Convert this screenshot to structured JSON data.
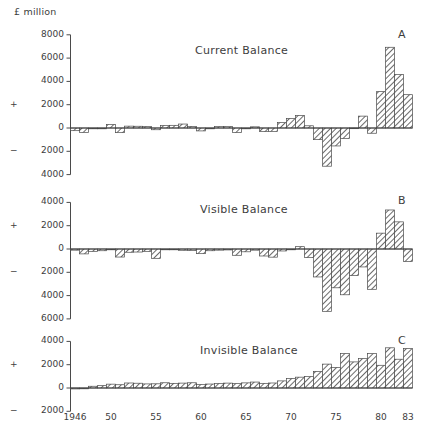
{
  "figure": {
    "unit_label": "£ million",
    "plus_sign": "+",
    "minus_sign": "−"
  },
  "xaxis": {
    "tick_labels": [
      "1946",
      "50",
      "55",
      "60",
      "65",
      "70",
      "75",
      "80",
      "83"
    ],
    "tick_years": [
      1946,
      1950,
      1955,
      1960,
      1965,
      1970,
      1975,
      1980,
      1983
    ],
    "range": [
      1946,
      1983
    ]
  },
  "panels": [
    {
      "letter": "A",
      "title": "Current Balance",
      "ylim": [
        -4000,
        8000
      ],
      "yticks": [
        8000,
        6000,
        4000,
        2000,
        0,
        -2000,
        -4000
      ],
      "ytick_labels": [
        "8000",
        "6000",
        "4000",
        "2000",
        "0",
        "2000",
        "4000"
      ]
    },
    {
      "letter": "B",
      "title": "Visible Balance",
      "ylim": [
        -6000,
        4000
      ],
      "yticks": [
        4000,
        2000,
        0,
        -2000,
        -4000,
        -6000
      ],
      "ytick_labels": [
        "4000",
        "2000",
        "0",
        "2000",
        "4000",
        "6000"
      ]
    },
    {
      "letter": "C",
      "title": "Invisible Balance",
      "ylim": [
        -2000,
        4000
      ],
      "yticks": [
        4000,
        2000,
        0,
        -2000
      ],
      "ytick_labels": [
        "4000",
        "2000",
        "0",
        "2000"
      ]
    }
  ],
  "chart_data": [
    {
      "type": "bar",
      "title": "Current Balance",
      "panel": "A",
      "xlabel": "",
      "ylabel": "£ million",
      "ylim": [
        -4000,
        8000
      ],
      "grid": false,
      "categories": [
        1946,
        1947,
        1948,
        1949,
        1950,
        1951,
        1952,
        1953,
        1954,
        1955,
        1956,
        1957,
        1958,
        1959,
        1960,
        1961,
        1962,
        1963,
        1964,
        1965,
        1966,
        1967,
        1968,
        1969,
        1970,
        1971,
        1972,
        1973,
        1974,
        1975,
        1976,
        1977,
        1978,
        1979,
        1980,
        1981,
        1982,
        1983
      ],
      "values": [
        -230,
        -380,
        -20,
        -10,
        300,
        -400,
        160,
        150,
        120,
        -150,
        210,
        230,
        340,
        140,
        -250,
        -10,
        120,
        120,
        -390,
        -50,
        100,
        -310,
        -290,
        460,
        820,
        1080,
        190,
        -1000,
        -3280,
        -1540,
        -900,
        10,
        1020,
        -450,
        3120,
        6930,
        4590,
        2860
      ]
    },
    {
      "type": "bar",
      "title": "Visible Balance",
      "panel": "B",
      "xlabel": "",
      "ylabel": "£ million",
      "ylim": [
        -6000,
        4000
      ],
      "grid": false,
      "categories": [
        1946,
        1947,
        1948,
        1949,
        1950,
        1951,
        1952,
        1953,
        1954,
        1955,
        1956,
        1957,
        1958,
        1959,
        1960,
        1961,
        1962,
        1963,
        1964,
        1965,
        1966,
        1967,
        1968,
        1969,
        1970,
        1971,
        1972,
        1973,
        1974,
        1975,
        1976,
        1977,
        1978,
        1979,
        1980,
        1981,
        1982,
        1983
      ],
      "values": [
        -100,
        -420,
        -200,
        -150,
        -50,
        -690,
        -280,
        -260,
        -200,
        -800,
        -50,
        -30,
        -110,
        -120,
        -400,
        -150,
        -100,
        -80,
        -540,
        -240,
        -100,
        -600,
        -700,
        -170,
        -20,
        200,
        -740,
        -2400,
        -5350,
        -3330,
        -3930,
        -2280,
        -1540,
        -3460,
        1360,
        3350,
        2330,
        -1070
      ]
    },
    {
      "type": "bar",
      "title": "Invisible Balance",
      "panel": "C",
      "xlabel": "",
      "ylabel": "£ million",
      "ylim": [
        -2000,
        4000
      ],
      "grid": false,
      "categories": [
        1946,
        1947,
        1948,
        1949,
        1950,
        1951,
        1952,
        1953,
        1954,
        1955,
        1956,
        1957,
        1958,
        1959,
        1960,
        1961,
        1962,
        1963,
        1964,
        1965,
        1966,
        1967,
        1968,
        1969,
        1970,
        1971,
        1972,
        1973,
        1974,
        1975,
        1976,
        1977,
        1978,
        1979,
        1980,
        1981,
        1982,
        1983
      ],
      "values": [
        -80,
        -60,
        150,
        200,
        330,
        280,
        430,
        410,
        350,
        360,
        450,
        400,
        420,
        450,
        300,
        340,
        390,
        420,
        380,
        440,
        510,
        400,
        430,
        610,
        820,
        930,
        980,
        1420,
        2050,
        1760,
        2950,
        2240,
        2520,
        2950,
        1950,
        3450,
        2470,
        3380
      ]
    }
  ]
}
